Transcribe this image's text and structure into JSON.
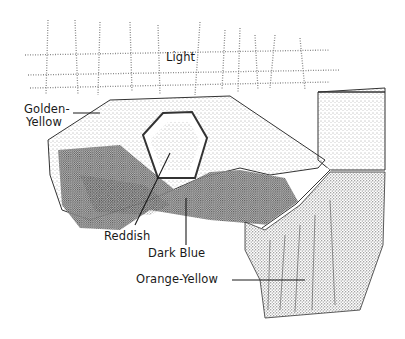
{
  "diagram": {
    "type": "stippled ink illustration",
    "labels": {
      "light": "Light",
      "golden_yellow_line1": "Golden-",
      "golden_yellow_line2": "Yellow",
      "reddish": "Reddish",
      "dark_blue": "Dark Blue",
      "orange_yellow": "Orange-Yellow"
    },
    "colors": {
      "ink": "#1a1a1a",
      "paper": "#ffffff"
    }
  }
}
